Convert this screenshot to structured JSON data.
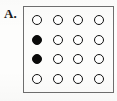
{
  "figure": {
    "panel_label": "A.",
    "accent_color": "#0a0a0a",
    "border_color": "#6e6e6e",
    "background_color": "#fcfcfb"
  },
  "chart_data": {
    "type": "heatmap",
    "title": "A.",
    "subtitle": "",
    "xlabel": "",
    "ylabel": "",
    "grid": true,
    "legend": "none",
    "rows": 4,
    "columns": 4,
    "state_legend": {
      "open": "unfilled circle",
      "filled": "filled circle"
    },
    "colors": {
      "open_fill": "#ffffff",
      "open_stroke": "#111111",
      "filled_fill": "#0a0a0a",
      "filled_stroke": "#0a0a0a"
    },
    "cells": [
      [
        {
          "row": 1,
          "col": 1,
          "state": "open",
          "value": 0
        },
        {
          "row": 1,
          "col": 2,
          "state": "open",
          "value": 0
        },
        {
          "row": 1,
          "col": 3,
          "state": "open",
          "value": 0
        },
        {
          "row": 1,
          "col": 4,
          "state": "open",
          "value": 0
        }
      ],
      [
        {
          "row": 2,
          "col": 1,
          "state": "filled",
          "value": 1
        },
        {
          "row": 2,
          "col": 2,
          "state": "open",
          "value": 0
        },
        {
          "row": 2,
          "col": 3,
          "state": "open",
          "value": 0
        },
        {
          "row": 2,
          "col": 4,
          "state": "open",
          "value": 0
        }
      ],
      [
        {
          "row": 3,
          "col": 1,
          "state": "filled",
          "value": 1
        },
        {
          "row": 3,
          "col": 2,
          "state": "open",
          "value": 0
        },
        {
          "row": 3,
          "col": 3,
          "state": "open",
          "value": 0
        },
        {
          "row": 3,
          "col": 4,
          "state": "open",
          "value": 0
        }
      ],
      [
        {
          "row": 4,
          "col": 1,
          "state": "open",
          "value": 0
        },
        {
          "row": 4,
          "col": 2,
          "state": "open",
          "value": 0
        },
        {
          "row": 4,
          "col": 3,
          "state": "open",
          "value": 0
        },
        {
          "row": 4,
          "col": 4,
          "state": "open",
          "value": 0
        }
      ]
    ],
    "values": [
      [
        0,
        0,
        0,
        0
      ],
      [
        1,
        0,
        0,
        0
      ],
      [
        1,
        0,
        0,
        0
      ],
      [
        0,
        0,
        0,
        0
      ]
    ],
    "filled_count": 2,
    "total_count": 16
  }
}
